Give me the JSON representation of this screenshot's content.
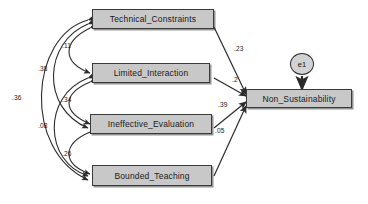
{
  "diagram": {
    "nodes": [
      {
        "id": "technical_constraints",
        "label": "Technical_Constraints",
        "kind": "observed-variable"
      },
      {
        "id": "limited_interaction",
        "label": "Limited_Interaction",
        "kind": "observed-variable"
      },
      {
        "id": "ineffective_evaluation",
        "label": "Ineffective_Evaluation",
        "kind": "observed-variable"
      },
      {
        "id": "bounded_teaching",
        "label": "Bounded_Teaching",
        "kind": "observed-variable"
      },
      {
        "id": "non_sustainability",
        "label": "Non_Sustainability",
        "kind": "endogenous-variable"
      },
      {
        "id": "e1",
        "label": "e1",
        "kind": "error-term"
      }
    ],
    "correlations": [
      {
        "id": "corr-tc-li",
        "from": "technical_constraints",
        "to": "limited_interaction",
        "value": ".11"
      },
      {
        "id": "corr-tc-ie",
        "from": "technical_constraints",
        "to": "ineffective_evaluation",
        "value": ".38"
      },
      {
        "id": "corr-tc-bt",
        "from": "technical_constraints",
        "to": "bounded_teaching",
        "value": ".36"
      },
      {
        "id": "corr-li-ie",
        "from": "limited_interaction",
        "to": "ineffective_evaluation",
        "value": ".34"
      },
      {
        "id": "corr-li-bt",
        "from": "limited_interaction",
        "to": "bounded_teaching",
        "value": ".08"
      },
      {
        "id": "corr-ie-bt",
        "from": "ineffective_evaluation",
        "to": "bounded_teaching",
        "value": ".26"
      }
    ],
    "paths": [
      {
        "id": "path-tc-ns",
        "from": "technical_constraints",
        "to": "non_sustainability",
        "value": ".23"
      },
      {
        "id": "path-li-ns",
        "from": "limited_interaction",
        "to": "non_sustainability",
        "value": ".2"
      },
      {
        "id": "path-ie-ns",
        "from": "ineffective_evaluation",
        "to": "non_sustainability",
        "value": ".39"
      },
      {
        "id": "path-bt-ns",
        "from": "bounded_teaching",
        "to": "non_sustainability",
        "value": ".05"
      }
    ],
    "error_paths": [
      {
        "id": "err-e1-ns",
        "from": "e1",
        "to": "non_sustainability"
      }
    ],
    "colors": {
      "box_fill": "#c8c8c8",
      "box_stroke": "#3a3a3a",
      "circle_fill": "#d2d2d2",
      "arrow_stroke": "#2b2b2b",
      "text": "#1a1a1a",
      "background": "#ffffff"
    }
  }
}
